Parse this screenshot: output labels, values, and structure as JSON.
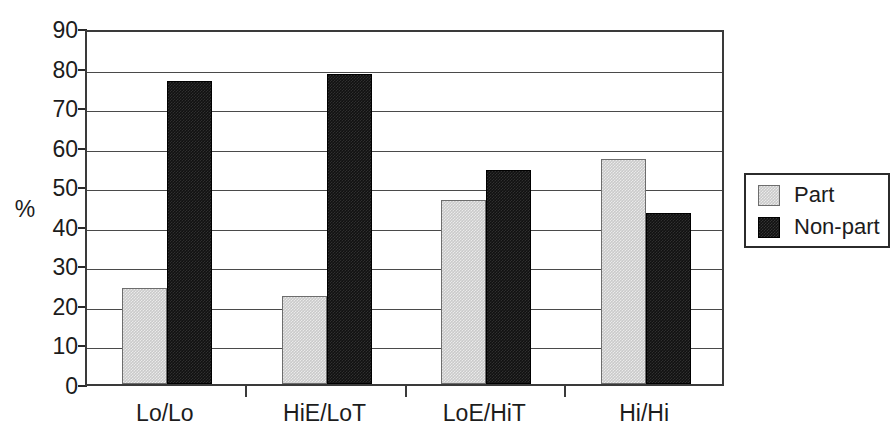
{
  "chart_data": {
    "type": "bar",
    "title": "",
    "xlabel": "",
    "ylabel": "%",
    "categories": [
      "Lo/Lo",
      "HiE/LoT",
      "LoE/HiT",
      "Hi/Hi"
    ],
    "series": [
      {
        "name": "Part",
        "color": "#cacaca",
        "values": [
          24.3,
          22.2,
          46.5,
          57.0
        ]
      },
      {
        "name": "Non-part",
        "color": "#111111",
        "values": [
          76.5,
          78.3,
          54.0,
          43.3
        ]
      }
    ],
    "ylim": [
      0,
      90
    ],
    "ytick_step": 10,
    "yticks": [
      "0",
      "10",
      "20",
      "30",
      "40",
      "50",
      "60",
      "70",
      "80",
      "90"
    ],
    "grid": true,
    "legend_position": "right"
  },
  "legend": {
    "entries": [
      {
        "label": "Part"
      },
      {
        "label": "Non-part"
      }
    ]
  },
  "axes": {
    "y_title": "%"
  }
}
